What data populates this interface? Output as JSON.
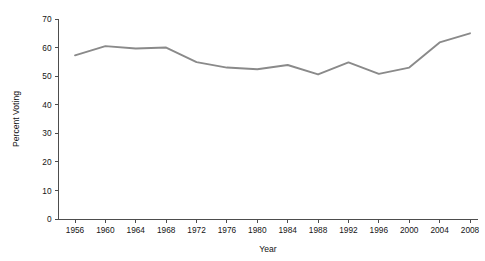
{
  "chart_data": {
    "type": "line",
    "title": "",
    "xlabel": "Year",
    "ylabel": "Percent Voting",
    "xlim": [
      1954,
      2010
    ],
    "ylim": [
      0,
      70
    ],
    "grid": false,
    "legend": "none",
    "line_color": "#8a8a8a",
    "axis_color": "#4d4d4d",
    "x_ticks": [
      1956,
      1960,
      1964,
      1968,
      1972,
      1976,
      1980,
      1984,
      1988,
      1992,
      1996,
      2000,
      2004,
      2008
    ],
    "y_ticks": [
      0,
      10,
      20,
      30,
      40,
      50,
      60,
      70
    ],
    "x": [
      1956,
      1960,
      1964,
      1968,
      1972,
      1976,
      1980,
      1984,
      1988,
      1992,
      1996,
      2000,
      2004,
      2008
    ],
    "values": [
      57.3,
      60.5,
      59.7,
      60.0,
      54.9,
      53.0,
      52.4,
      53.9,
      50.6,
      54.8,
      50.8,
      53.0,
      61.8,
      65.0
    ],
    "series": [
      {
        "name": "Percent Voting",
        "values": [
          57.3,
          60.5,
          59.7,
          60.0,
          54.9,
          53.0,
          52.4,
          53.9,
          50.6,
          54.8,
          50.8,
          53.0,
          61.8,
          65.0
        ]
      }
    ]
  }
}
